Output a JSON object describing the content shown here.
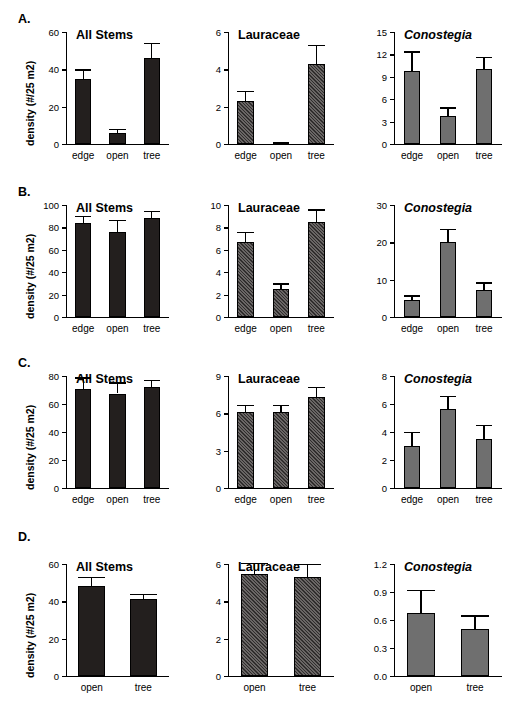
{
  "figure": {
    "y_axis_label": "density (#/25 m2)",
    "colors": {
      "all_stems_bar": "#231f1e",
      "lauraceae_bar": "#555150",
      "conostegia_bar": "#6f6f6f",
      "axis": "#000000",
      "background": "#ffffff"
    }
  },
  "rows": [
    {
      "label": "A.",
      "panels": [
        {
          "chart_data": {
            "type": "bar",
            "title": "All Stems",
            "title_italic": false,
            "categories": [
              "edge",
              "open",
              "tree"
            ],
            "values": [
              35,
              6,
              46
            ],
            "errors": [
              5,
              2,
              8
            ],
            "xlabel": "",
            "ylabel": "density (#/25 m2)",
            "ylim": [
              0,
              60
            ],
            "yticks": [
              0,
              20,
              40,
              60
            ],
            "ytick_labels": [
              "0",
              "20",
              "40",
              "60"
            ],
            "grid": false,
            "legend": "none"
          }
        },
        {
          "chart_data": {
            "type": "bar",
            "title": "Lauraceae",
            "title_italic": false,
            "categories": [
              "edge",
              "open",
              "tree"
            ],
            "values": [
              2.3,
              0.05,
              4.3
            ],
            "errors": [
              0.55,
              0.05,
              1.0
            ],
            "xlabel": "",
            "ylabel": "",
            "ylim": [
              0,
              6
            ],
            "yticks": [
              0,
              2,
              4,
              6
            ],
            "ytick_labels": [
              "0",
              "2",
              "4",
              "6"
            ],
            "grid": false,
            "legend": "none"
          }
        },
        {
          "chart_data": {
            "type": "bar",
            "title": "Conostegia",
            "title_italic": true,
            "categories": [
              "edge",
              "open",
              "tree"
            ],
            "values": [
              9.8,
              3.8,
              10.1
            ],
            "errors": [
              2.6,
              1.1,
              1.6
            ],
            "xlabel": "",
            "ylabel": "",
            "ylim": [
              0,
              15
            ],
            "yticks": [
              0,
              3,
              6,
              9,
              12,
              15
            ],
            "ytick_labels": [
              "0",
              "3",
              "6",
              "9",
              "12",
              "15"
            ],
            "grid": false,
            "legend": "none"
          }
        }
      ]
    },
    {
      "label": "B.",
      "panels": [
        {
          "chart_data": {
            "type": "bar",
            "title": "All Stems",
            "title_italic": false,
            "categories": [
              "edge",
              "open",
              "tree"
            ],
            "values": [
              84,
              76,
              88
            ],
            "errors": [
              6,
              11,
              7
            ],
            "xlabel": "",
            "ylabel": "density (#/25 m2)",
            "ylim": [
              0,
              100
            ],
            "yticks": [
              0,
              20,
              40,
              60,
              80,
              100
            ],
            "ytick_labels": [
              "0",
              "20",
              "40",
              "60",
              "80",
              "100"
            ],
            "grid": false,
            "legend": "none"
          }
        },
        {
          "chart_data": {
            "type": "bar",
            "title": "Lauraceae",
            "title_italic": false,
            "categories": [
              "edge",
              "open",
              "tree"
            ],
            "values": [
              6.7,
              2.5,
              8.5
            ],
            "errors": [
              0.9,
              0.5,
              1.1
            ],
            "xlabel": "",
            "ylabel": "",
            "ylim": [
              0,
              10
            ],
            "yticks": [
              0,
              2,
              4,
              6,
              8,
              10
            ],
            "ytick_labels": [
              "0",
              "2",
              "4",
              "6",
              "8",
              "10"
            ],
            "grid": false,
            "legend": "none"
          }
        },
        {
          "chart_data": {
            "type": "bar",
            "title": "Conostegia",
            "title_italic": true,
            "categories": [
              "edge",
              "open",
              "tree"
            ],
            "values": [
              4.6,
              20.1,
              7.1
            ],
            "errors": [
              1.2,
              3.6,
              2.2
            ],
            "xlabel": "",
            "ylabel": "",
            "ylim": [
              0,
              30
            ],
            "yticks": [
              0,
              10,
              20,
              30
            ],
            "ytick_labels": [
              "0",
              "10",
              "20",
              "30"
            ],
            "grid": false,
            "legend": "none"
          }
        }
      ]
    },
    {
      "label": "C.",
      "panels": [
        {
          "chart_data": {
            "type": "bar",
            "title": "All Stems",
            "title_italic": false,
            "categories": [
              "edge",
              "open",
              "tree"
            ],
            "values": [
              71,
              67.5,
              72
            ],
            "errors": [
              8,
              8,
              5
            ],
            "xlabel": "",
            "ylabel": "density (#/25 m2)",
            "ylim": [
              0,
              80
            ],
            "yticks": [
              0,
              20,
              40,
              60,
              80
            ],
            "ytick_labels": [
              "0",
              "20",
              "40",
              "60",
              "80"
            ],
            "grid": false,
            "legend": "none"
          }
        },
        {
          "chart_data": {
            "type": "bar",
            "title": "Lauraceae",
            "title_italic": false,
            "categories": [
              "edge",
              "open",
              "tree"
            ],
            "values": [
              6.1,
              6.1,
              7.3
            ],
            "errors": [
              0.6,
              0.6,
              0.8
            ],
            "xlabel": "",
            "ylabel": "",
            "ylim": [
              0,
              9
            ],
            "yticks": [
              0,
              3,
              6,
              9
            ],
            "ytick_labels": [
              "0",
              "3",
              "6",
              "9"
            ],
            "grid": false,
            "legend": "none"
          }
        },
        {
          "chart_data": {
            "type": "bar",
            "title": "Conostegia",
            "title_italic": true,
            "categories": [
              "edge",
              "open",
              "tree"
            ],
            "values": [
              3.0,
              5.65,
              3.5
            ],
            "errors": [
              1.0,
              0.95,
              1.0
            ],
            "xlabel": "",
            "ylabel": "",
            "ylim": [
              0,
              8
            ],
            "yticks": [
              0,
              2,
              4,
              6,
              8
            ],
            "ytick_labels": [
              "0",
              "2",
              "4",
              "6",
              "8"
            ],
            "grid": false,
            "legend": "none"
          }
        }
      ]
    },
    {
      "label": "D.",
      "panels": [
        {
          "chart_data": {
            "type": "bar",
            "title": "All Stems",
            "title_italic": false,
            "categories": [
              "open",
              "tree"
            ],
            "values": [
              48,
              41
            ],
            "errors": [
              5,
              3
            ],
            "xlabel": "",
            "ylabel": "density (#/25 m2)",
            "ylim": [
              0,
              60
            ],
            "yticks": [
              0,
              20,
              40,
              60
            ],
            "ytick_labels": [
              "0",
              "20",
              "40",
              "60"
            ],
            "grid": false,
            "legend": "none"
          }
        },
        {
          "chart_data": {
            "type": "bar",
            "title": "Lauraceae",
            "title_italic": false,
            "categories": [
              "open",
              "tree"
            ],
            "values": [
              5.45,
              5.3
            ],
            "errors": [
              0.6,
              0.7
            ],
            "xlabel": "",
            "ylabel": "",
            "ylim": [
              0,
              6
            ],
            "yticks": [
              0,
              2,
              4,
              6
            ],
            "ytick_labels": [
              "0",
              "2",
              "4",
              "6"
            ],
            "grid": false,
            "legend": "none"
          }
        },
        {
          "chart_data": {
            "type": "bar",
            "title": "Conostegia",
            "title_italic": true,
            "categories": [
              "open",
              "tree"
            ],
            "values": [
              0.67,
              0.5
            ],
            "errors": [
              0.25,
              0.15
            ],
            "xlabel": "",
            "ylabel": "",
            "ylim": [
              0,
              1.2
            ],
            "yticks": [
              0,
              0.3,
              0.6,
              0.9,
              1.2
            ],
            "ytick_labels": [
              "0.0",
              "0.3",
              "0.6",
              "0.9",
              "1.2"
            ],
            "grid": false,
            "legend": "none"
          }
        }
      ]
    }
  ]
}
